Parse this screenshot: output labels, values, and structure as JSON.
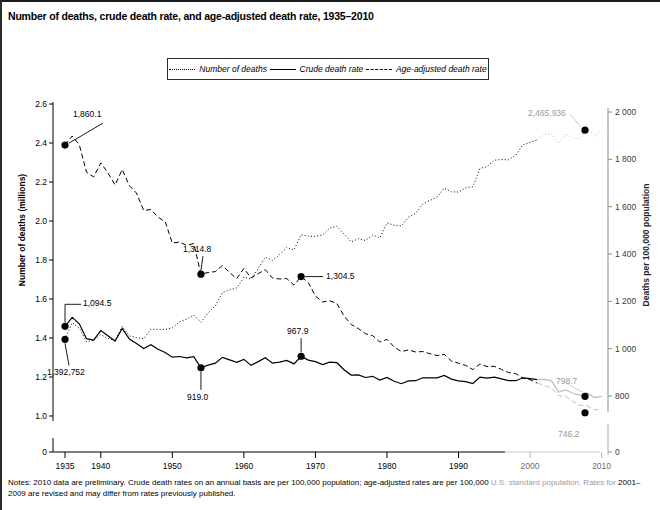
{
  "chart_title": "Number of deaths, crude death rate, and age-adjusted death rate, 1935–2010",
  "legend": {
    "items": [
      {
        "label": "Number of deaths",
        "style": "dotted",
        "icon": "dotted-line-icon"
      },
      {
        "label": "Crude death rate",
        "style": "solid",
        "icon": "solid-line-icon"
      },
      {
        "label": "Age-adjusted death rate",
        "style": "dashed",
        "icon": "dashed-line-icon"
      }
    ]
  },
  "notes": {
    "main": "Notes: 2010 data are preliminary. Crude death rates on an annual basis are per 100,000 population; age-adjusted rates are per 100,000 ",
    "tail": "U.S. standard population. Rates for",
    "line2": "2001–2009 are revised and may differ from rates previously published."
  },
  "chart_data": {
    "type": "line",
    "title": "Number of deaths, crude death rate, and age-adjusted death rate, 1935–2010",
    "xlabel": "",
    "ylabel": "Number of deaths (millions)",
    "ylabel_right": "Deaths per 100,000 population",
    "xlim": [
      1935,
      2010
    ],
    "ylim": [
      0,
      2.6
    ],
    "ylim_right": [
      0,
      2000
    ],
    "grid": false,
    "legend_position": "top-center",
    "xticks": [
      1935,
      1940,
      1950,
      1960,
      1970,
      1980,
      1990,
      2000,
      2010
    ],
    "xticklabels": [
      "1935",
      "1940",
      "1950",
      "1960",
      "1970",
      "1980",
      "1990",
      "2000",
      "2010"
    ],
    "yticks_left": [
      0,
      1.0,
      1.2,
      1.4,
      1.6,
      1.8,
      2.0,
      2.2,
      2.4,
      2.6
    ],
    "yticklabels_left": [
      "0",
      "1.0",
      "1.2",
      "1.4",
      "1.6",
      "1.8",
      "2.0",
      "2.2",
      "2.4",
      "2.6"
    ],
    "yticks_right": [
      0,
      800,
      1000,
      1200,
      1400,
      1600,
      1800,
      2000
    ],
    "yticklabels_right": [
      "0",
      "800",
      "1 000",
      "1 200",
      "1 400",
      "1 600",
      "1 800",
      "2 000"
    ],
    "series": [
      {
        "name": "Number of deaths",
        "axis": "left",
        "units": "millions",
        "style": "dotted",
        "x": [
          1935,
          1936,
          1937,
          1938,
          1939,
          1940,
          1941,
          1942,
          1943,
          1944,
          1945,
          1946,
          1947,
          1948,
          1949,
          1950,
          1951,
          1952,
          1953,
          1954,
          1955,
          1956,
          1957,
          1958,
          1959,
          1960,
          1961,
          1962,
          1963,
          1964,
          1965,
          1966,
          1967,
          1968,
          1969,
          1970,
          1971,
          1972,
          1973,
          1974,
          1975,
          1976,
          1977,
          1978,
          1979,
          1980,
          1981,
          1982,
          1983,
          1984,
          1985,
          1986,
          1987,
          1988,
          1989,
          1990,
          1991,
          1992,
          1993,
          1994,
          1995,
          1996,
          1997,
          1998,
          1999,
          2000,
          2001,
          2002,
          2003,
          2004,
          2005,
          2006,
          2007,
          2008,
          2009,
          2010
        ],
        "y": [
          1.393,
          1.479,
          1.45,
          1.381,
          1.388,
          1.417,
          1.398,
          1.386,
          1.459,
          1.411,
          1.402,
          1.396,
          1.445,
          1.444,
          1.444,
          1.452,
          1.483,
          1.497,
          1.518,
          1.481,
          1.529,
          1.565,
          1.633,
          1.647,
          1.657,
          1.712,
          1.702,
          1.757,
          1.814,
          1.798,
          1.828,
          1.864,
          1.852,
          1.93,
          1.922,
          1.921,
          1.928,
          1.964,
          1.973,
          1.934,
          1.893,
          1.91,
          1.9,
          1.928,
          1.914,
          1.99,
          1.978,
          1.975,
          2.019,
          2.039,
          2.086,
          2.105,
          2.123,
          2.168,
          2.15,
          2.148,
          2.17,
          2.176,
          2.269,
          2.279,
          2.312,
          2.315,
          2.314,
          2.337,
          2.391,
          2.403,
          2.416,
          2.443,
          2.448,
          2.398,
          2.448,
          2.426,
          2.423,
          2.472,
          2.437,
          2.466
        ],
        "endpoint_label": "2,465,936"
      },
      {
        "name": "Crude death rate",
        "axis": "right",
        "units": "deaths per 100,000 population",
        "style": "solid",
        "x": [
          1935,
          1936,
          1937,
          1938,
          1939,
          1940,
          1941,
          1942,
          1943,
          1944,
          1945,
          1946,
          1947,
          1948,
          1949,
          1950,
          1951,
          1952,
          1953,
          1954,
          1955,
          1956,
          1957,
          1958,
          1959,
          1960,
          1961,
          1962,
          1963,
          1964,
          1965,
          1966,
          1967,
          1968,
          1969,
          1970,
          1971,
          1972,
          1973,
          1974,
          1975,
          1976,
          1977,
          1978,
          1979,
          1980,
          1981,
          1982,
          1983,
          1984,
          1985,
          1986,
          1987,
          1988,
          1989,
          1990,
          1991,
          1992,
          1993,
          1994,
          1995,
          1996,
          1997,
          1998,
          1999,
          2000,
          2001,
          2002,
          2003,
          2004,
          2005,
          2006,
          2007,
          2008,
          2009,
          2010
        ],
        "y": [
          1094.5,
          1132.1,
          1105.2,
          1042.0,
          1036.0,
          1076.4,
          1054.5,
          1031.9,
          1085.7,
          1040.3,
          1021.3,
          1000.5,
          1016.6,
          997.2,
          984.0,
          963.8,
          966.9,
          961.5,
          966.0,
          919.0,
          930.4,
          938.4,
          963.1,
          952.4,
          942.1,
          954.7,
          929.2,
          945.3,
          961.9,
          938.5,
          943.2,
          950.5,
          935.7,
          967.9,
          951.9,
          945.3,
          933.1,
          942.9,
          940.6,
          911.0,
          888.5,
          889.0,
          878.1,
          883.4,
          867.7,
          878.3,
          862.0,
          852.1,
          863.6,
          864.8,
          876.9,
          876.7,
          876.4,
          886.7,
          871.3,
          863.8,
          860.3,
          852.9,
          880.0,
          875.4,
          880.0,
          872.5,
          864.7,
          864.7,
          877.0,
          873.1,
          869.1,
          870.4,
          863.8,
          816.5,
          825.9,
          810.4,
          803.6,
          813.2,
          793.8,
          798.7
        ],
        "annotations": [
          {
            "x": 1935,
            "y": 1094.5,
            "label": "1,094.5"
          },
          {
            "x": 1954,
            "y": 919.0,
            "label": "919.0"
          },
          {
            "x": 1968,
            "y": 967.9,
            "label": "967.9"
          }
        ],
        "endpoint_label": "798.7"
      },
      {
        "name": "Age-adjusted death rate",
        "axis": "right",
        "units": "deaths per 100,000 U.S. standard population",
        "style": "dashed",
        "x": [
          1935,
          1936,
          1937,
          1938,
          1939,
          1940,
          1941,
          1942,
          1943,
          1944,
          1945,
          1946,
          1947,
          1948,
          1949,
          1950,
          1951,
          1952,
          1953,
          1954,
          1955,
          1956,
          1957,
          1958,
          1959,
          1960,
          1961,
          1962,
          1963,
          1964,
          1965,
          1966,
          1967,
          1968,
          1969,
          1970,
          1971,
          1972,
          1973,
          1974,
          1975,
          1976,
          1977,
          1978,
          1979,
          1980,
          1981,
          1982,
          1983,
          1984,
          1985,
          1986,
          1987,
          1988,
          1989,
          1990,
          1991,
          1992,
          1993,
          1994,
          1995,
          1996,
          1997,
          1998,
          1999,
          2000,
          2001,
          2002,
          2003,
          2004,
          2005,
          2006,
          2007,
          2008,
          2009,
          2010
        ],
        "y": [
          1860.1,
          1898.4,
          1861.4,
          1746.2,
          1725.6,
          1785.0,
          1743.2,
          1691.5,
          1757.1,
          1688.5,
          1657.5,
          1583.9,
          1588.0,
          1556.1,
          1536.3,
          1446.0,
          1450.6,
          1436.5,
          1444.3,
          1314.8,
          1321.8,
          1325.5,
          1351.2,
          1321.5,
          1295.8,
          1339.2,
          1299.0,
          1317.0,
          1333.8,
          1298.2,
          1294.4,
          1296.0,
          1268.4,
          1304.5,
          1278.7,
          1222.6,
          1197.0,
          1202.3,
          1190.4,
          1138.2,
          1102.1,
          1085.0,
          1063.4,
          1054.8,
          1028.1,
          1039.1,
          1007.7,
          987.5,
          994.7,
          986.1,
          988.1,
          978.9,
          970.9,
          976.2,
          948.0,
          938.7,
          929.5,
          911.5,
          935.6,
          924.1,
          925.3,
          912.4,
          899.0,
          894.4,
          875.6,
          869.0,
          854.5,
          845.3,
          832.7,
          800.8,
          798.8,
          776.5,
          760.2,
          758.3,
          741.1,
          746.2
        ],
        "annotations": [
          {
            "x": 1935,
            "y": 1860.1,
            "label": "1,860.1"
          },
          {
            "x": 1954,
            "y": 1314.8,
            "label": "1,314.8"
          },
          {
            "x": 1968,
            "y": 1304.5,
            "label": "1,304.5"
          }
        ],
        "endpoint_label": "746.2"
      }
    ],
    "start_markers": [
      {
        "series": "Number of deaths",
        "x": 1935,
        "label": "1,392,752"
      },
      {
        "series": "Crude death rate",
        "x": 1935,
        "label": "1,094.5"
      },
      {
        "series": "Age-adjusted death rate",
        "x": 1935,
        "label": "1,860.1"
      }
    ]
  }
}
